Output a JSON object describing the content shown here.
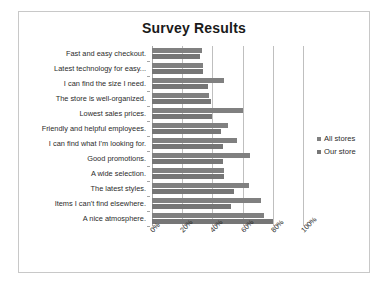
{
  "figure": {
    "caption": ""
  },
  "legend": {
    "position": "right",
    "entries": [
      {
        "label": "All stores",
        "color": "#808080"
      },
      {
        "label": "Our store",
        "color": "#767676"
      }
    ]
  },
  "chart_data": {
    "type": "bar",
    "orientation": "horizontal",
    "title": "Survey Results",
    "xlabel": "",
    "ylabel": "",
    "xlim": [
      0,
      100
    ],
    "xticks": [
      "0%",
      "20%",
      "40%",
      "60%",
      "80%",
      "100%"
    ],
    "xtick_values": [
      0,
      20,
      40,
      60,
      80,
      100
    ],
    "grid": true,
    "categories": [
      "Fast and easy checkout.",
      "Latest technology for easy...",
      "I can find the size I need.",
      "The store is well-organized.",
      "Lowest sales prices.",
      "Friendly and helpful employees.",
      "I can find what I'm looking for.",
      "Good promotions.",
      "A wide selection.",
      "The latest styles.",
      "Items I can't find elsewhere.",
      "A nice atmosphere."
    ],
    "series": [
      {
        "name": "All stores",
        "color": "#808080",
        "values": [
          33,
          34,
          48,
          38,
          60,
          50,
          56,
          65,
          48,
          64,
          72,
          74
        ]
      },
      {
        "name": "Our store",
        "color": "#767676",
        "values": [
          32,
          34,
          37,
          39,
          40,
          46,
          47,
          47,
          48,
          54,
          52,
          80
        ]
      }
    ]
  }
}
